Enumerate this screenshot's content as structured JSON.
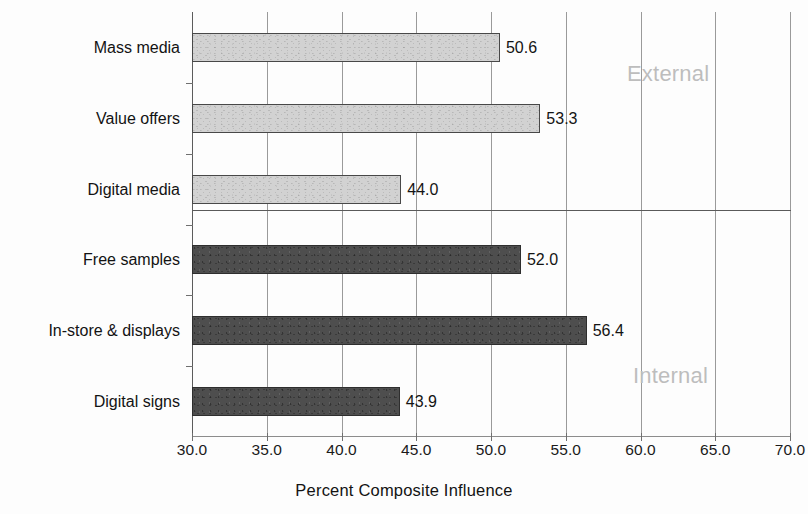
{
  "chart_data": {
    "type": "bar",
    "orientation": "horizontal",
    "title": "",
    "xlabel": "Percent Composite Influence",
    "ylabel": "",
    "xlim": [
      30.0,
      70.0
    ],
    "xticks": [
      "30.0",
      "35.0",
      "40.0",
      "45.0",
      "50.0",
      "55.0",
      "60.0",
      "65.0",
      "70.0"
    ],
    "xtick_values": [
      30.0,
      35.0,
      40.0,
      45.0,
      50.0,
      55.0,
      60.0,
      65.0,
      70.0
    ],
    "grid": true,
    "grid_axis": "x",
    "legend": "none",
    "categories": [
      "Mass media",
      "Value offers",
      "Digital media",
      "Free samples",
      "In-store & displays",
      "Digital signs"
    ],
    "values": [
      50.6,
      53.3,
      44.0,
      52.0,
      56.4,
      43.9
    ],
    "value_labels": [
      "50.6",
      "53.3",
      "44.0",
      "52.0",
      "56.4",
      "43.9"
    ],
    "groups": [
      {
        "name": "External",
        "label": "External",
        "categories": [
          "Mass media",
          "Value offers",
          "Digital media"
        ],
        "color": "#d2d2d2"
      },
      {
        "name": "Internal",
        "label": "Internal",
        "categories": [
          "Free samples",
          "In-store & displays",
          "Digital signs"
        ],
        "color": "#4e4e4e"
      }
    ],
    "bars": [
      {
        "category": "Mass media",
        "value": 50.6,
        "label": "50.6",
        "group": "External"
      },
      {
        "category": "Value offers",
        "value": 53.3,
        "label": "53.3",
        "group": "External"
      },
      {
        "category": "Digital media",
        "value": 44.0,
        "label": "44.0",
        "group": "External"
      },
      {
        "category": "Free samples",
        "value": 52.0,
        "label": "52.0",
        "group": "Internal"
      },
      {
        "category": "In-store & displays",
        "value": 56.4,
        "label": "56.4",
        "group": "Internal"
      },
      {
        "category": "Digital signs",
        "value": 43.9,
        "label": "43.9",
        "group": "Internal"
      }
    ],
    "annotations": [
      {
        "text": "External",
        "color": "#bdbdbd"
      },
      {
        "text": "Internal",
        "color": "#bdbdbd"
      }
    ],
    "colors": {
      "external_bar": "#d2d2d2",
      "internal_bar": "#4e4e4e",
      "bar_border": "#3f3f3f",
      "gridline": "#9a9a9a",
      "axis": "#6f6f6f",
      "text": "#131313",
      "annotation": "#bdbdbd",
      "background": "#fdfdfd"
    }
  }
}
